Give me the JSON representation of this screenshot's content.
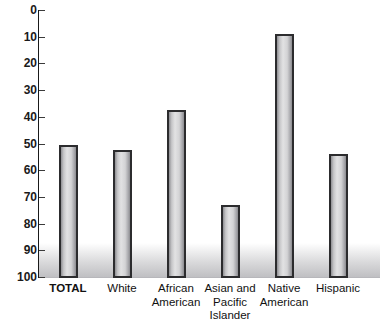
{
  "chart_data": {
    "type": "bar",
    "title": "",
    "xlabel": "",
    "ylabel": "",
    "ylim": [
      0,
      100
    ],
    "yticks": [
      0,
      10,
      20,
      30,
      40,
      50,
      60,
      70,
      80,
      90,
      100
    ],
    "grid": false,
    "legend": null,
    "categories": [
      "TOTAL",
      "White",
      "African American",
      "Asian and Pacific Islander",
      "Native American",
      "Hispanic"
    ],
    "category_lines": [
      [
        "TOTAL"
      ],
      [
        "White"
      ],
      [
        "African",
        "American"
      ],
      [
        "Asian and",
        "Pacific",
        "Islander"
      ],
      [
        "Native",
        "American"
      ],
      [
        "Hispanic"
      ]
    ],
    "values": [
      49.5,
      47.5,
      62.5,
      27,
      91,
      46
    ],
    "bar_fill_color": "#d3d3d5",
    "bar_outline_color": "#2c2c2e",
    "axis_color": "#1a1a1a",
    "text_color": "#111111"
  },
  "axis": {
    "tick_labels": [
      "100",
      "90",
      "80",
      "70",
      "60",
      "50",
      "40",
      "30",
      "20",
      "10",
      "0"
    ]
  },
  "title_sliver": {
    "text": ""
  }
}
